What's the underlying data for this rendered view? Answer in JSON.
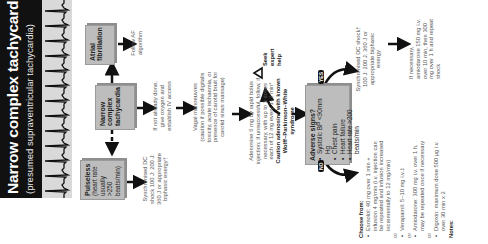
{
  "title": {
    "main": "Narrow complex tachycardia",
    "subtitle": "(presumed supraventricular tachycardia)"
  },
  "ecg_strip": {
    "description": "ECG rhythm strip showing regular narrow QRS complexes",
    "background_color": "#d9d9d9",
    "trace_color": "#111111"
  },
  "colors": {
    "title_band": "#111111",
    "box_fill": "#bdbdbd",
    "box_shadow": "#8e8e8e",
    "text": "#333333",
    "arrow": "#111111"
  },
  "boxes": {
    "atrial_fibrillation": "Atrial fibrillation",
    "narrow_complex": "Narrow complex tachycardia",
    "pulseless": {
      "title": "Pulseless",
      "detail": "(heart rate usually >250 beats/min)"
    },
    "adverse_signs": {
      "title": "Adverse signs?",
      "items": [
        "Systolic BP <90mm Hg",
        "Chest pain",
        "Heart failure",
        "Heart rate >200 beats/min"
      ]
    }
  },
  "notes": {
    "follow_af": "Follow AF algorithm",
    "oxygen_iv": "If not already done, give oxygen and establish IV access",
    "pulseless_shock": "Synchronised DC shock 100 J: 200 J: 360 J or appropriate biphasic energy†",
    "vagal_title": "Vagal manoeuvres",
    "vagal_detail": "(caution if possible digitalis toxicity, acute ischaemia, or presence of carotid bruit for carotid sinus massage)",
    "adenosine": "Adenosine 6 mg by rapid bolus injection; if unsuccessful, follow, if necessary, with up to 3 doses each of 12 mg every 1–2 min*",
    "adenosine_caution": "Caution adenosine with known Wolff–Parkinson–White syndrome",
    "seek_help": "Seek expert help",
    "yes_label": "YES",
    "no_label": "NO",
    "yes_shock": "Synchronised DC shock† 100 J: 200 J: 360 J or appropriate biphasic energy",
    "amiodarone_repeat": "If necessary, amiodarone 150 mg i.v. over 10 min, then 300 mg over 1 h and repeat shock"
  },
  "choose_from": {
    "title": "Choose from:",
    "or_label": "or",
    "options": [
      "Esmolol: 40 mg over 1 min + infusion 4 mg/min (i.v. injection can be repeated and infusion increased incrementally to 12 mg/min)",
      "Verapamil: 5–10 mg i.v.‡",
      "Amiodarone: 300 mg i.v. over 1 h, may be repeated once if necessary",
      "Digoxin: maximum dose 500 µg i.v. over 30 min x 2"
    ]
  },
  "footer": {
    "notes_label": "Notes:"
  }
}
